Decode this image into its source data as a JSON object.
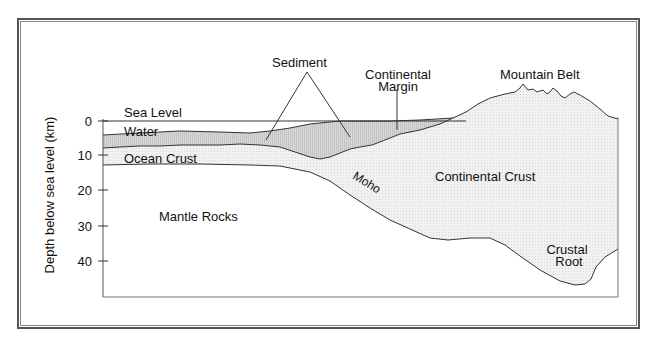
{
  "axis": {
    "ylabel": "Depth below sea level (km)",
    "ticks": [
      {
        "label": "0",
        "y": 121
      },
      {
        "label": "10",
        "y": 155
      },
      {
        "label": "20",
        "y": 190
      },
      {
        "label": "30",
        "y": 226
      },
      {
        "label": "40",
        "y": 261
      }
    ]
  },
  "labels": {
    "sea_level": "Sea Level",
    "water": "Water",
    "ocean_crust": "Ocean Crust",
    "mantle_rocks": "Mantle Rocks",
    "sediment": "Sediment",
    "continental_margin_1": "Continental",
    "continental_margin_2": "Margin",
    "mountain_belt": "Mountain Belt",
    "continental_crust": "Continental Crust",
    "moho": "Moho",
    "crustal_root_1": "Crustal",
    "crustal_root_2": "Root"
  },
  "colors": {
    "line": "#2a2a2a",
    "crust_fill": "#ececec",
    "sediment_fill": "#cfcfcf",
    "frame": "#555555"
  }
}
